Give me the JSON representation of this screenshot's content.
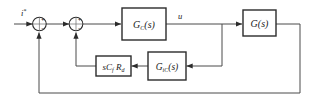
{
  "diagram": {
    "background_color": "#ffffff",
    "line_color": "#3a3a3a",
    "block_fill": "#ffffff",
    "block_stroke": "#2b2b2b",
    "text_color": "#1a1a1a"
  },
  "signals": {
    "input_label": "i",
    "input_superscript": "*",
    "control_label": "u"
  },
  "summing_junctions": [
    {
      "id": "sum1",
      "name": "outer-summing-junction",
      "signs": {
        "input": "+",
        "feedback": "−"
      }
    },
    {
      "id": "sum2",
      "name": "inner-summing-junction",
      "signs": {
        "input": "+",
        "feedback": "−"
      }
    }
  ],
  "blocks": [
    {
      "id": "gc",
      "name": "controller-block",
      "base": "G",
      "subscript": "C",
      "argument": "(s)"
    },
    {
      "id": "g",
      "name": "plant-block",
      "base": "G",
      "subscript": "",
      "argument": "(s)"
    },
    {
      "id": "gic",
      "name": "inner-controller-block",
      "base": "G",
      "subscript": "iC",
      "argument": "(s)"
    },
    {
      "id": "scfrd",
      "name": "damping-gain-block",
      "term1": "s",
      "term2": "C",
      "sub2": "f",
      "term3": "R",
      "sub3": "d"
    }
  ],
  "connections": [
    {
      "name": "input-to-sum1",
      "from": "input",
      "to": "sum1"
    },
    {
      "name": "sum1-to-sum2",
      "from": "sum1",
      "to": "sum2"
    },
    {
      "name": "sum2-to-controller",
      "from": "sum2",
      "to": "gc"
    },
    {
      "name": "controller-to-plant",
      "from": "gc",
      "to": "g"
    },
    {
      "name": "controller-tap-to-inner-loop",
      "from": "u-node",
      "to": "gic"
    },
    {
      "name": "inner-controller-to-damping-gain",
      "from": "gic",
      "to": "scfrd"
    },
    {
      "name": "damping-gain-to-sum2",
      "from": "scfrd",
      "to": "sum2"
    },
    {
      "name": "plant-output-feedback-to-sum1",
      "from": "g",
      "to": "sum1"
    }
  ]
}
